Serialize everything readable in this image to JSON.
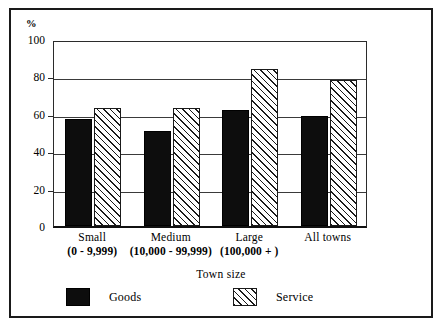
{
  "figure": {
    "y_axis_unit_label": "%",
    "x_axis_title": "Town size"
  },
  "legend": {
    "items": [
      {
        "label": "Goods",
        "swatch": "solid-black-swatch"
      },
      {
        "label": "Service",
        "swatch": "diagonal-hatch-swatch"
      }
    ]
  },
  "chart_data": {
    "type": "bar",
    "title": "",
    "xlabel": "Town size",
    "ylabel": "%",
    "ylim": [
      0,
      100
    ],
    "yticks": [
      0,
      20,
      40,
      60,
      80,
      100
    ],
    "ytick_labels": [
      "0",
      "20",
      "40",
      "60",
      "80",
      "100"
    ],
    "grid": true,
    "legend_position": "bottom",
    "categories": [
      "Small",
      "Medium",
      "Large",
      "All towns"
    ],
    "category_sublabels": [
      "(0 - 9,999)",
      "(10,000 - 99,999)",
      "(100,000 + )",
      ""
    ],
    "series": [
      {
        "name": "Goods",
        "values": [
          57,
          51,
          62,
          59
        ]
      },
      {
        "name": "Service",
        "values": [
          63,
          63,
          84,
          78
        ]
      }
    ]
  }
}
